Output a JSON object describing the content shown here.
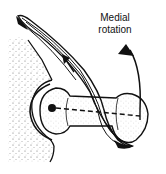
{
  "diagram": {
    "label": {
      "line1": "Medial",
      "line2": "rotation"
    },
    "elements": [
      {
        "name": "pelvis-socket",
        "description": "stippled bone with socket"
      },
      {
        "name": "femur-head-and-neck",
        "description": "ball and shaft of bone"
      },
      {
        "name": "muscle-band",
        "description": "striped muscle with arrow showing pull"
      },
      {
        "name": "rotation-axis",
        "description": "dashed line from pivot point"
      },
      {
        "name": "rotation-arrow",
        "description": "curved arrow indicating medial rotation"
      }
    ],
    "colors": {
      "ink": "#111111",
      "background": "#ffffff",
      "stipple": "#555555"
    }
  }
}
